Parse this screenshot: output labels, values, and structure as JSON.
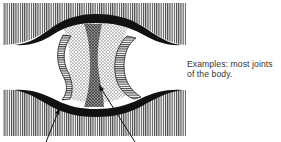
{
  "diagram": {
    "caption": {
      "line1": "Examples: most joints",
      "line2": "of the body."
    },
    "parts": [
      {
        "name": "upper-bone",
        "pattern": "vertical-hatch"
      },
      {
        "name": "lower-bone",
        "pattern": "vertical-hatch"
      },
      {
        "name": "articular-cartilage",
        "fill": "#111111"
      },
      {
        "name": "synovial-fluid",
        "pattern": "dots"
      },
      {
        "name": "articular-disc",
        "pattern": "cross-hatch"
      },
      {
        "name": "joint-capsule-left",
        "pattern": "horizontal-hatch"
      },
      {
        "name": "joint-capsule-right",
        "pattern": "horizontal-hatch"
      }
    ],
    "pointers": [
      {
        "name": "pointer-left",
        "target": "articular-cartilage"
      },
      {
        "name": "pointer-right",
        "target": "articular-disc"
      }
    ],
    "colors": {
      "ink": "#111111",
      "hatch": "#555555",
      "background": "#ffffff"
    }
  }
}
